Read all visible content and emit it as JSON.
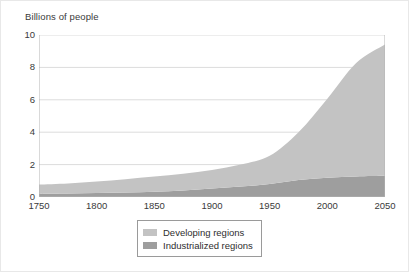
{
  "chart_data": {
    "type": "area",
    "title": "",
    "subtitle": "",
    "ylabel": "Billions of people",
    "xlabel": "",
    "xlim": [
      1750,
      2050
    ],
    "ylim": [
      0,
      10
    ],
    "grid": true,
    "stacked": true,
    "legend_position": "bottom-center",
    "xticks": [
      1750,
      1800,
      1850,
      1900,
      1950,
      2000,
      2050
    ],
    "yticks": [
      0,
      2,
      4,
      6,
      8,
      10
    ],
    "x": [
      1750,
      1775,
      1800,
      1825,
      1850,
      1875,
      1900,
      1925,
      1950,
      1975,
      2000,
      2025,
      2050
    ],
    "series": [
      {
        "name": "Industrialized regions",
        "color": "#9e9e9e",
        "values": [
          0.19,
          0.21,
          0.24,
          0.28,
          0.33,
          0.4,
          0.52,
          0.65,
          0.81,
          1.05,
          1.19,
          1.27,
          1.31
        ]
      },
      {
        "name": "Developing regions",
        "color": "#c3c3c3",
        "values": [
          0.58,
          0.63,
          0.71,
          0.82,
          0.93,
          1.04,
          1.15,
          1.35,
          1.73,
          2.95,
          4.88,
          7.0,
          8.1
        ]
      }
    ],
    "totals": [
      0.77,
      0.84,
      0.95,
      1.1,
      1.26,
      1.44,
      1.67,
      2.0,
      2.54,
      4.0,
      6.07,
      8.27,
      9.41
    ],
    "annotations": []
  },
  "legend": {
    "items": [
      {
        "label": "Developing regions",
        "color": "#c3c3c3"
      },
      {
        "label": "Industrialized regions",
        "color": "#9e9e9e"
      }
    ]
  },
  "style": {
    "gridline_color": "#dcdcdc",
    "axis_color": "#b4b4b4",
    "text_color": "#3a3a3a",
    "background": "#ffffff"
  }
}
